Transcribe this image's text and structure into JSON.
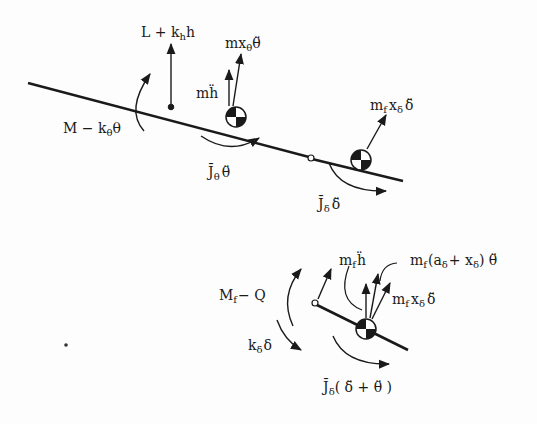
{
  "diagram": {
    "colors": {
      "ink": "#1a1a1a",
      "background": "#fdfdfd"
    },
    "top": {
      "labels": {
        "lift": "L + k",
        "lift_sub": "h",
        "lift_tail": "h",
        "moment": "M − k",
        "moment_sub": "θ",
        "moment_tail": "θ",
        "mh": "mḧ",
        "mx": "mx",
        "mx_sub": "θ",
        "mx_tail": "θ̈",
        "Jtheta": "J̄",
        "Jtheta_sub": "θ",
        "Jtheta_tail": "θ̈",
        "mfx": "m",
        "mfx_sub1": "f",
        "mfx_mid": "x",
        "mfx_sub2": "δ",
        "mfx_tail": "δ̈",
        "Jdelta": "J̄",
        "Jdelta_sub": "δ",
        "Jdelta_tail": "δ̈"
      }
    },
    "bottom": {
      "labels": {
        "Mf": "M",
        "Mf_sub": "f",
        "Mf_tail": "− Q",
        "kd": "k",
        "kd_sub": "δ",
        "kd_tail": "δ",
        "mfh": "m",
        "mfh_sub": "f",
        "mfh_tail": "ḧ",
        "mfa": "m",
        "mfa_sub": "f",
        "mfa_mid": "(a",
        "mfa_sub2": "δ",
        "mfa_mid2": "+ x",
        "mfa_sub3": "δ",
        "mfa_tail": ") θ̈",
        "mfx": "m",
        "mfx_sub1": "f",
        "mfx_mid": "x",
        "mfx_sub2": "δ",
        "mfx_tail": "δ̈",
        "J": "J̄",
        "J_sub": "δ",
        "J_tail": "( δ̈ + θ̈ )"
      }
    }
  }
}
